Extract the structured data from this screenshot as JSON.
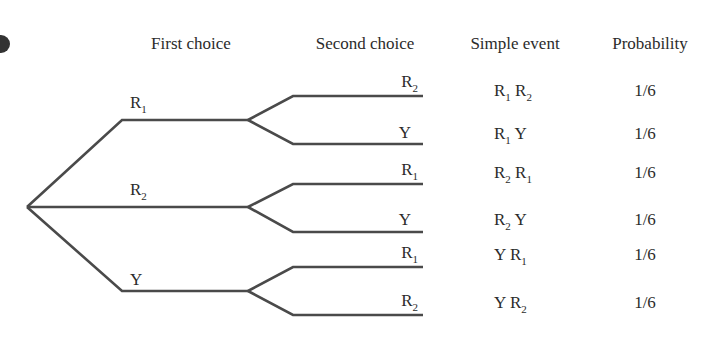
{
  "headers": {
    "first": "First choice",
    "second": "Second choice",
    "event": "Simple event",
    "prob": "Probability"
  },
  "first_level": [
    {
      "base": "R",
      "sub": "1"
    },
    {
      "base": "R",
      "sub": "2"
    },
    {
      "base": "Y",
      "sub": ""
    }
  ],
  "second_level": [
    {
      "base": "R",
      "sub": "2"
    },
    {
      "base": "Y",
      "sub": ""
    },
    {
      "base": "R",
      "sub": "1"
    },
    {
      "base": "Y",
      "sub": ""
    },
    {
      "base": "R",
      "sub": "1"
    },
    {
      "base": "R",
      "sub": "2"
    }
  ],
  "events": [
    {
      "a": "R",
      "a_sub": "1",
      "b": "R",
      "b_sub": "2",
      "prob": "1/6"
    },
    {
      "a": "R",
      "a_sub": "1",
      "b": "Y",
      "b_sub": "",
      "prob": "1/6"
    },
    {
      "a": "R",
      "a_sub": "2",
      "b": "R",
      "b_sub": "1",
      "prob": "1/6"
    },
    {
      "a": "R",
      "a_sub": "2",
      "b": "Y",
      "b_sub": "",
      "prob": "1/6"
    },
    {
      "a": "Y",
      "a_sub": "",
      "b": "R",
      "b_sub": "1",
      "prob": "1/6"
    },
    {
      "a": "Y",
      "a_sub": "",
      "b": "R",
      "b_sub": "2",
      "prob": "1/6"
    }
  ],
  "colors": {
    "line": "#4a4a4a",
    "text": "#2b2b2b"
  }
}
